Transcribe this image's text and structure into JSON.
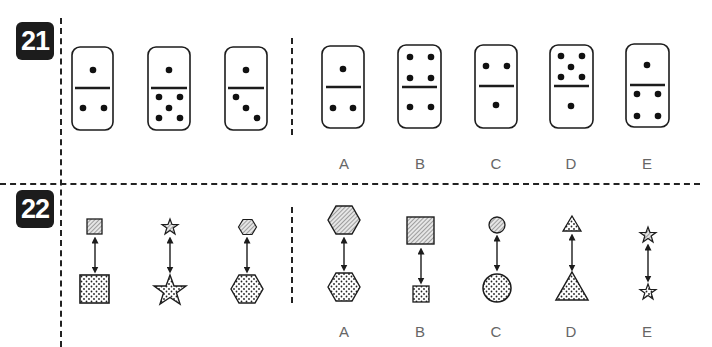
{
  "questions": [
    {
      "number": "21",
      "type": "domino-analogy",
      "given": [
        {
          "top": 1,
          "bottom": 2
        },
        {
          "top": 1,
          "bottom": 5
        },
        {
          "top": 1,
          "bottom": 3
        }
      ],
      "options": [
        {
          "label": "A",
          "top": 1,
          "bottom": 2
        },
        {
          "label": "B",
          "top": 4,
          "bottom": 2
        },
        {
          "label": "C",
          "top": 2,
          "bottom": 1
        },
        {
          "label": "D",
          "top": 5,
          "bottom": 1
        },
        {
          "label": "E",
          "top": 1,
          "bottom": 4
        }
      ]
    },
    {
      "number": "22",
      "type": "shape-pair-analogy",
      "given": [
        {
          "shape": "square",
          "top": "small-hatched",
          "bottom": "large-dotted"
        },
        {
          "shape": "star",
          "top": "small-hatched",
          "bottom": "large-dotted"
        },
        {
          "shape": "hexagon",
          "top": "small-hatched",
          "bottom": "large-dotted"
        }
      ],
      "options": [
        {
          "label": "A",
          "shape": "hexagon",
          "top": "large-hatched",
          "bottom": "large-dotted"
        },
        {
          "label": "B",
          "shape": "square",
          "top": "large-hatched",
          "bottom": "small-dotted"
        },
        {
          "label": "C",
          "shape": "circle",
          "top": "small-hatched",
          "bottom": "large-dotted"
        },
        {
          "label": "D",
          "shape": "triangle",
          "top": "small-dotted",
          "bottom": "large-dotted"
        },
        {
          "label": "E",
          "shape": "star",
          "top": "small-hatched",
          "bottom": "small-dotted"
        }
      ]
    }
  ],
  "colors": {
    "ink": "#1c1c1c",
    "label": "#666666",
    "background": "#ffffff"
  }
}
